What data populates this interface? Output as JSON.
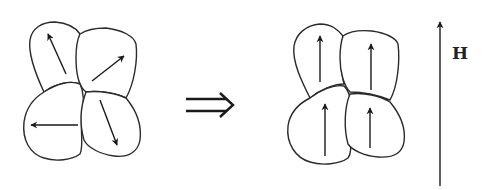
{
  "diagram": {
    "before": {
      "grains": [
        {
          "name": "top-left",
          "direction": "up-left"
        },
        {
          "name": "top-right",
          "direction": "up-right"
        },
        {
          "name": "bottom-left",
          "direction": "left"
        },
        {
          "name": "bottom-right",
          "direction": "down"
        }
      ]
    },
    "transition_symbol": "⇒",
    "after": {
      "grains": [
        {
          "name": "top-left",
          "direction": "up"
        },
        {
          "name": "top-right",
          "direction": "up"
        },
        {
          "name": "bottom-left",
          "direction": "up"
        },
        {
          "name": "bottom-right",
          "direction": "up"
        }
      ]
    },
    "field": {
      "label": "H",
      "direction": "up"
    },
    "colors": {
      "stroke": "#2a2a2a",
      "background": "#ffffff"
    }
  }
}
